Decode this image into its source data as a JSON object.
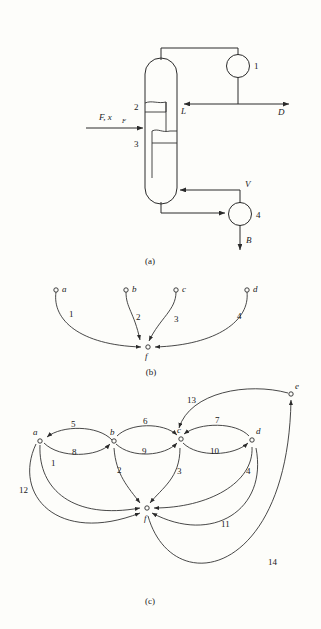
{
  "figure": {
    "background_color": "#fdfdfa",
    "line_color": "#2a2a2a",
    "panels": [
      {
        "id": "a",
        "caption": "(a)",
        "kind": "process-flow-diagram"
      },
      {
        "id": "b",
        "caption": "(b)",
        "kind": "directed-graph"
      },
      {
        "id": "c",
        "caption": "(c)",
        "kind": "directed-graph"
      }
    ]
  },
  "panel_a": {
    "caption": "(a)",
    "title": "distillation-column-flowsheet",
    "units": [
      {
        "id": "1",
        "label": "1",
        "name": "condenser"
      },
      {
        "id": "4",
        "label": "4",
        "name": "reboiler"
      }
    ],
    "column_sections": [
      {
        "label": "2",
        "name": "rectifying-section"
      },
      {
        "label": "3",
        "name": "stripping-section"
      }
    ],
    "streams": [
      {
        "name": "feed",
        "label": "F, x",
        "sub": "F"
      },
      {
        "name": "reflux",
        "label": "L"
      },
      {
        "name": "distillate",
        "label": "D"
      },
      {
        "name": "vapor",
        "label": "V"
      },
      {
        "name": "bottoms",
        "label": "B"
      }
    ]
  },
  "panel_b": {
    "caption": "(b)",
    "nodes": [
      {
        "id": "a",
        "label": "a"
      },
      {
        "id": "b",
        "label": "b"
      },
      {
        "id": "c",
        "label": "c"
      },
      {
        "id": "d",
        "label": "d"
      },
      {
        "id": "f",
        "label": "f"
      }
    ],
    "edges": [
      {
        "label": "1",
        "from": "a",
        "to": "f"
      },
      {
        "label": "2",
        "from": "b",
        "to": "f"
      },
      {
        "label": "3",
        "from": "c",
        "to": "f"
      },
      {
        "label": "4",
        "from": "d",
        "to": "f"
      }
    ]
  },
  "panel_c": {
    "caption": "(c)",
    "nodes": [
      {
        "id": "a",
        "label": "a"
      },
      {
        "id": "b",
        "label": "b"
      },
      {
        "id": "c",
        "label": "c"
      },
      {
        "id": "d",
        "label": "d"
      },
      {
        "id": "e",
        "label": "e"
      },
      {
        "id": "f",
        "label": "f"
      }
    ],
    "edges": [
      {
        "label": "1",
        "from": "a",
        "to": "f"
      },
      {
        "label": "2",
        "from": "b",
        "to": "f"
      },
      {
        "label": "3",
        "from": "c",
        "to": "f"
      },
      {
        "label": "4",
        "from": "d",
        "to": "f"
      },
      {
        "label": "5",
        "from": "b",
        "to": "a"
      },
      {
        "label": "6",
        "from": "b",
        "to": "c"
      },
      {
        "label": "7",
        "from": "d",
        "to": "c"
      },
      {
        "label": "8",
        "from": "a",
        "to": "b"
      },
      {
        "label": "9",
        "from": "b",
        "to": "c"
      },
      {
        "label": "10",
        "from": "c",
        "to": "d"
      },
      {
        "label": "11",
        "from": "d",
        "to": "f"
      },
      {
        "label": "12",
        "from": "a",
        "to": "f"
      },
      {
        "label": "13",
        "from": "e",
        "to": "c"
      },
      {
        "label": "14",
        "from": "f",
        "to": "e"
      }
    ]
  }
}
